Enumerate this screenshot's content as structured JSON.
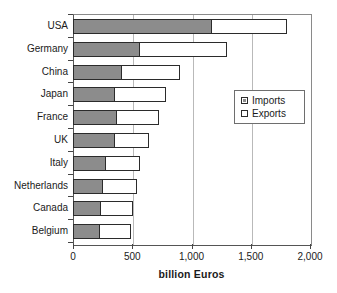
{
  "chart_data": {
    "type": "bar",
    "orientation": "horizontal",
    "stacked": true,
    "title": "",
    "xlabel": "billion Euros",
    "ylabel": "",
    "xlim": [
      0,
      2000
    ],
    "xticks": [
      0,
      500,
      1000,
      1500,
      2000
    ],
    "xtick_labels": [
      "0",
      "500",
      "1,000",
      "1,500",
      "2,000"
    ],
    "grid": "vertical",
    "legend_position": "middle-right",
    "categories": [
      "USA",
      "Germany",
      "China",
      "Japan",
      "France",
      "UK",
      "Italy",
      "Netherlands",
      "Canada",
      "Belgium"
    ],
    "series": [
      {
        "name": "Imports",
        "color": "#8c8c8c",
        "values": [
          1170,
          565,
          410,
          355,
          370,
          355,
          280,
          250,
          235,
          230
        ]
      },
      {
        "name": "Exports",
        "color": "#ffffff",
        "values": [
          635,
          735,
          490,
          430,
          355,
          285,
          285,
          290,
          270,
          260
        ]
      }
    ],
    "totals": [
      1805,
      1300,
      900,
      785,
      725,
      640,
      565,
      540,
      505,
      490
    ]
  },
  "legend": {
    "items": [
      {
        "label": "Imports",
        "swatch": "filled-square-icon"
      },
      {
        "label": "Exports",
        "swatch": "empty-square-icon"
      }
    ]
  },
  "colors": {
    "imports_fill": "#8c8c8c",
    "exports_fill": "#ffffff",
    "bar_outline": "#2b2b2b",
    "gridline": "#b9b9b9",
    "axis": "#555555",
    "text": "#1a1a1a"
  }
}
